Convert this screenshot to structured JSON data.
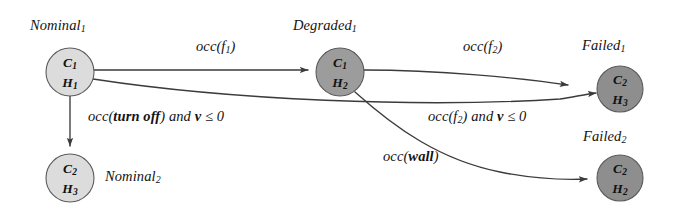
{
  "diagram": {
    "type": "state-transition-diagram",
    "background_color": "#ffffff",
    "nodes": [
      {
        "id": "nominal1",
        "label": "Nominal",
        "label_sub": "1",
        "line1": "C",
        "line1_sub": "1",
        "line2": "H",
        "line2_sub": "1",
        "fill": "#dcdcdc",
        "cx": 70,
        "cy": 72,
        "r": 24,
        "label_x": 30,
        "label_y": 17
      },
      {
        "id": "degraded1",
        "label": "Degraded",
        "label_sub": "1",
        "line1": "C",
        "line1_sub": "1",
        "line2": "H",
        "line2_sub": "2",
        "fill": "#9c9c9c",
        "cx": 340,
        "cy": 72,
        "r": 24,
        "label_x": 293,
        "label_y": 17
      },
      {
        "id": "failed1",
        "label": "Failed",
        "label_sub": "1",
        "line1": "C",
        "line1_sub": "2",
        "line2": "H",
        "line2_sub": "3",
        "fill": "#8e8e8e",
        "cx": 620,
        "cy": 89,
        "r": 23,
        "label_x": 582,
        "label_y": 37
      },
      {
        "id": "nominal2",
        "label": "Nominal",
        "label_sub": "2",
        "line1": "C",
        "line1_sub": "2",
        "line2": "H",
        "line2_sub": "3",
        "fill": "#dcdcdc",
        "cx": 70,
        "cy": 178,
        "r": 24,
        "label_x": 105,
        "label_y": 168
      },
      {
        "id": "failed2",
        "label": "Failed",
        "label_sub": "2",
        "line1": "C",
        "line1_sub": "2",
        "line2": "H",
        "line2_sub": "2",
        "fill": "#8e8e8e",
        "cx": 620,
        "cy": 178,
        "r": 23,
        "label_x": 583,
        "label_y": 128
      }
    ],
    "edges": [
      {
        "id": "edge-nominal1-degraded1",
        "from": "nominal1",
        "to": "degraded1",
        "label_parts": [
          {
            "text": "occ(f",
            "style": "italic"
          },
          {
            "text": "1",
            "style": "sub"
          },
          {
            "text": ")",
            "style": "italic"
          }
        ],
        "label_x": 196,
        "label_y": 38
      },
      {
        "id": "edge-nominal1-nominal2",
        "from": "nominal1",
        "to": "nominal2",
        "label_parts": [
          {
            "text": "occ(",
            "style": "italic"
          },
          {
            "text": "turn off",
            "style": "bold"
          },
          {
            "text": ") and ",
            "style": "italic"
          },
          {
            "text": "v",
            "style": "bold"
          },
          {
            "text": " ≤ 0",
            "style": "italic"
          }
        ],
        "label_x": 88,
        "label_y": 108
      },
      {
        "id": "edge-nominal1-failed1",
        "from": "nominal1",
        "to": "failed1",
        "label_parts": [
          {
            "text": "occ(f",
            "style": "italic"
          },
          {
            "text": "2",
            "style": "sub"
          },
          {
            "text": ") and ",
            "style": "italic"
          },
          {
            "text": "v",
            "style": "bold"
          },
          {
            "text": " ≤ 0",
            "style": "italic"
          }
        ],
        "label_x": 428,
        "label_y": 108
      },
      {
        "id": "edge-degraded1-failed1",
        "from": "degraded1",
        "to": "failed1",
        "label_parts": [
          {
            "text": "occ(f",
            "style": "italic"
          },
          {
            "text": "2",
            "style": "sub"
          },
          {
            "text": ")",
            "style": "italic"
          }
        ],
        "label_x": 463,
        "label_y": 38
      },
      {
        "id": "edge-degraded1-failed2",
        "from": "degraded1",
        "to": "failed2",
        "label_parts": [
          {
            "text": "occ(",
            "style": "italic"
          },
          {
            "text": "wall",
            "style": "bold"
          },
          {
            "text": ")",
            "style": "italic"
          }
        ],
        "label_x": 383,
        "label_y": 148
      }
    ]
  }
}
